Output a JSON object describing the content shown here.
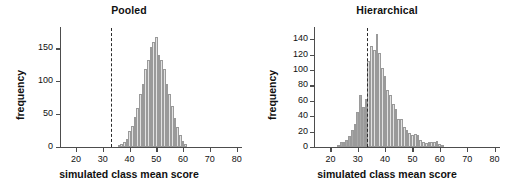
{
  "figure": {
    "background": "#ffffff",
    "panels": [
      "pooled",
      "hierarchical"
    ]
  },
  "chart_data": [
    {
      "id": "pooled",
      "type": "bar",
      "title": "Pooled",
      "xlabel": "simulated class mean score",
      "ylabel": "frequency",
      "xlim": [
        14,
        82
      ],
      "ylim": [
        0,
        178
      ],
      "xticks": [
        20,
        30,
        40,
        50,
        60,
        70,
        80
      ],
      "yticks": [
        0,
        50,
        100,
        150
      ],
      "grid": false,
      "legend": null,
      "bin_width": 1,
      "bar_fill": "#e2e2e2",
      "bar_edge": "#9a9a9a",
      "annotations": [
        {
          "kind": "vline",
          "label": "observed mean",
          "x": 33,
          "style": "dashed",
          "color": "#2b2b2b"
        }
      ],
      "x": [
        36,
        37,
        38,
        39,
        40,
        41,
        42,
        43,
        44,
        45,
        46,
        47,
        48,
        49,
        50,
        51,
        52,
        53,
        54,
        55,
        56,
        57,
        58,
        59,
        60,
        61
      ],
      "values": [
        3,
        5,
        8,
        12,
        24,
        32,
        45,
        60,
        80,
        96,
        118,
        133,
        152,
        160,
        168,
        140,
        132,
        118,
        96,
        80,
        62,
        44,
        30,
        18,
        9,
        4
      ]
    },
    {
      "id": "hierarchical",
      "type": "bar",
      "title": "Hierarchical",
      "xlabel": "simulated class mean score",
      "ylabel": "frequency",
      "xlim": [
        14,
        82
      ],
      "ylim": [
        0,
        152
      ],
      "xticks": [
        20,
        30,
        40,
        50,
        60,
        70,
        80
      ],
      "yticks": [
        0,
        20,
        40,
        60,
        80,
        100,
        120,
        140
      ],
      "grid": false,
      "legend": null,
      "bin_width": 1,
      "bar_fill": "#e2e2e2",
      "bar_edge": "#9a9a9a",
      "bar_fill_below_line": "#a8a8a8",
      "annotations": [
        {
          "kind": "vline",
          "label": "observed mean",
          "x": 33.5,
          "style": "dashed",
          "color": "#2b2b2b"
        }
      ],
      "x": [
        23,
        24,
        25,
        26,
        27,
        28,
        29,
        30,
        31,
        32,
        33,
        34,
        35,
        36,
        37,
        38,
        39,
        40,
        41,
        42,
        43,
        44,
        45,
        46,
        47,
        48,
        49,
        50,
        51,
        52,
        53,
        54,
        55,
        56,
        57,
        58,
        59,
        60,
        61
      ],
      "values": [
        3,
        6,
        7,
        9,
        14,
        22,
        30,
        46,
        67,
        52,
        62,
        112,
        131,
        126,
        147,
        122,
        103,
        92,
        74,
        67,
        56,
        50,
        36,
        37,
        26,
        22,
        18,
        15,
        17,
        16,
        9,
        6,
        5,
        6,
        6,
        7,
        8,
        4,
        2
      ]
    }
  ]
}
